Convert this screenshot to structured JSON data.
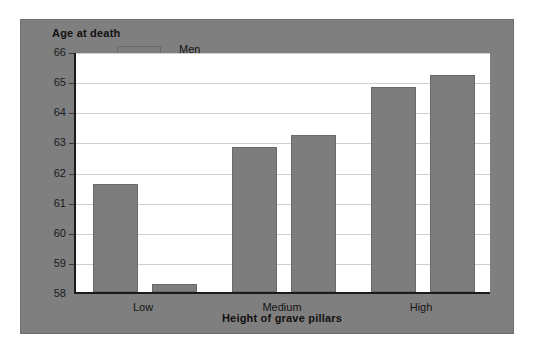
{
  "chart_data": {
    "type": "bar",
    "title": "",
    "ylabel": "Age at death",
    "xlabel": "Height of grave pillars",
    "categories": [
      "Low",
      "Medium",
      "High"
    ],
    "series": [
      {
        "name": "Men",
        "color": "#7d7d7d",
        "values": [
          61.6,
          62.8,
          64.8
        ]
      },
      {
        "name": "Women",
        "color": "#7d7d7d",
        "values": [
          58.25,
          63.2,
          65.2
        ]
      }
    ],
    "ylim": [
      58,
      66
    ],
    "yticks": [
      58,
      59,
      60,
      61,
      62,
      63,
      64,
      65,
      66
    ],
    "ytick_labels": [
      "58",
      "59",
      "60",
      "61",
      "62",
      "63",
      "64",
      "65",
      "66"
    ],
    "grid": true,
    "grid_axis": "y",
    "legend_position": "top-left-inside",
    "panel_color": "#7f7f7f",
    "plot_background": "#ffffff",
    "axis_color": "#1a1a1a",
    "gridline_color": "#cfcfcf"
  }
}
